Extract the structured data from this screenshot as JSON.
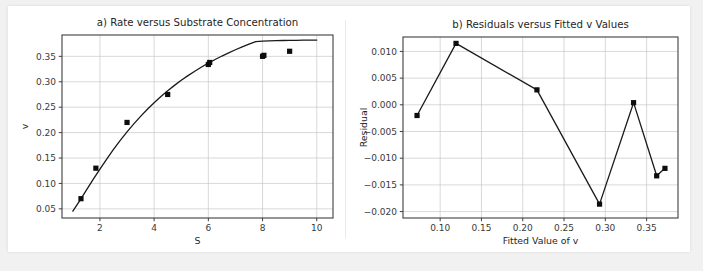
{
  "figure": {
    "background": "#f1f1f1",
    "card_background": "#ffffff",
    "marker_color": "#0d0d0d",
    "line_color": "#1a1a1a",
    "grid_color": "#c8c8c8"
  },
  "chart_data": [
    {
      "type": "scatter",
      "id": "panel-a",
      "title": "a) Rate versus Substrate Concentration",
      "xlabel": "S",
      "ylabel": "v",
      "xlim": [
        0.6,
        10.6
      ],
      "ylim": [
        0.032,
        0.392
      ],
      "xticks": [
        2,
        4,
        6,
        8,
        10
      ],
      "xtick_labels": [
        "2",
        "4",
        "6",
        "8",
        "10"
      ],
      "yticks": [
        0.05,
        0.1,
        0.15,
        0.2,
        0.25,
        0.3,
        0.35
      ],
      "ytick_labels": [
        "0.05",
        "0.10",
        "0.15",
        "0.20",
        "0.25",
        "0.30",
        "0.35"
      ],
      "grid": true,
      "legend": "none",
      "points": {
        "name": "Observed rate",
        "x": [
          1.3,
          1.85,
          3.0,
          4.5,
          6.0,
          6.05,
          8.0,
          8.05,
          9.0
        ],
        "y": [
          0.07,
          0.13,
          0.22,
          0.275,
          0.334,
          0.338,
          0.35,
          0.352,
          0.36
        ]
      },
      "series": [
        {
          "name": "Fitted Michaelis-Menten curve",
          "x": [
            1.0,
            1.25,
            1.5,
            1.75,
            2.0,
            2.25,
            2.5,
            2.75,
            3.0,
            3.25,
            3.5,
            3.75,
            4.0,
            4.25,
            4.5,
            4.75,
            5.0,
            5.25,
            5.5,
            5.75,
            6.0,
            6.25,
            6.5,
            6.75,
            7.0,
            7.25,
            7.5,
            7.75,
            8.0,
            8.25,
            8.5,
            8.75,
            9.0,
            9.25,
            9.5,
            9.75,
            10.0
          ],
          "y": [
            0.0455,
            0.0659,
            0.0869,
            0.1078,
            0.1283,
            0.148,
            0.1668,
            0.1846,
            0.2014,
            0.2172,
            0.232,
            0.2458,
            0.2588,
            0.2709,
            0.2823,
            0.2929,
            0.3028,
            0.3121,
            0.3208,
            0.329,
            0.3366,
            0.3438,
            0.3506,
            0.357,
            0.363,
            0.3687,
            0.374,
            0.379,
            0.38,
            0.3805,
            0.381,
            0.3812,
            0.3814,
            0.3816,
            0.3818,
            0.3819,
            0.382
          ]
        }
      ]
    },
    {
      "type": "line",
      "id": "panel-b",
      "title": "b) Residuals versus Fitted v Values",
      "xlabel": "Fitted Value of v",
      "ylabel": "Residual",
      "xlim": [
        0.055,
        0.388
      ],
      "ylim": [
        -0.0212,
        0.0127
      ],
      "xticks": [
        0.1,
        0.15,
        0.2,
        0.25,
        0.3,
        0.35
      ],
      "xtick_labels": [
        "0.10",
        "0.15",
        "0.20",
        "0.25",
        "0.30",
        "0.35"
      ],
      "yticks": [
        -0.02,
        -0.015,
        -0.01,
        -0.005,
        0.0,
        0.005,
        0.01
      ],
      "ytick_labels": [
        "−0.020",
        "−0.015",
        "−0.010",
        "−0.005",
        "0.000",
        "0.005",
        "0.010"
      ],
      "grid": true,
      "legend": "none",
      "points": {
        "name": "Residual",
        "x": [
          0.072,
          0.1192,
          0.2172,
          0.293,
          0.3342,
          0.3622,
          0.3722
        ],
        "y": [
          -0.002,
          0.0115,
          0.0028,
          -0.0186,
          0.0004,
          -0.0133,
          -0.0119
        ]
      },
      "series": [
        {
          "name": "Residual connector",
          "x": [
            0.072,
            0.1192,
            0.2172,
            0.293,
            0.3342,
            0.3622,
            0.3722
          ],
          "y": [
            -0.002,
            0.0115,
            0.0028,
            -0.0186,
            0.0004,
            -0.0133,
            -0.0119
          ]
        }
      ]
    }
  ]
}
